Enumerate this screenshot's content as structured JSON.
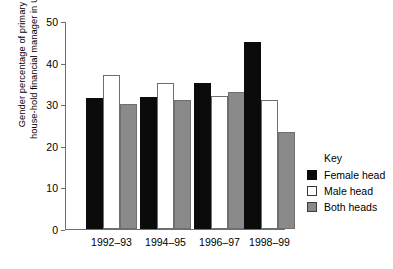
{
  "chart_data": {
    "type": "bar",
    "title": "",
    "xlabel": "",
    "ylabel_line1": "Gender percentage of primary",
    "ylabel_line2": "house-hold financial manager in US",
    "categories": [
      "1992–93",
      "1994–95",
      "1996–97",
      "1998–99"
    ],
    "series": [
      {
        "name": "Female head",
        "color": "#0b0b0b",
        "values": [
          31.5,
          31.8,
          35,
          45
        ]
      },
      {
        "name": "Male head",
        "color": "#ffffff",
        "values": [
          37,
          35,
          32,
          31
        ]
      },
      {
        "name": "Both heads",
        "color": "#8a8a8a",
        "values": [
          30,
          31,
          33,
          23.3
        ]
      }
    ],
    "ylim": [
      0,
      50
    ],
    "yticks": [
      0,
      10,
      20,
      30,
      40,
      50
    ],
    "ytick_labels": [
      "0",
      "10",
      "20",
      "30",
      "40",
      "50"
    ],
    "grid": false,
    "legend_position": "right",
    "legend_title": "Key"
  }
}
